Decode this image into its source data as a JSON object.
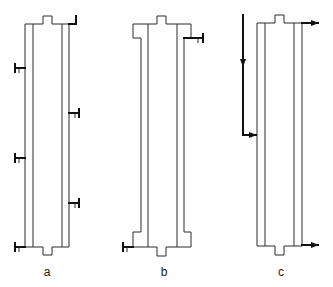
{
  "figure": {
    "panels": [
      {
        "id": "a",
        "label": "a",
        "description": "Jacketed column with multiple side valves on outer jacket",
        "valves": [
          "left-68",
          "right-113",
          "left-158",
          "right-203",
          "left-247"
        ],
        "top_port": "L-bracket outlet top-right"
      },
      {
        "id": "b",
        "label": "b",
        "description": "Jacketed column with widened end sections, one valve top-right and one bottom-left",
        "valves": [
          "right-38",
          "left-241"
        ]
      },
      {
        "id": "c",
        "label": "c",
        "description": "Jacketed column with flow arrows: inlet down and into left jacket, outlets at top-right and bottom-right",
        "arrows": [
          "inlet-down-left",
          "outlet-top-right",
          "outlet-bottom-right"
        ]
      }
    ],
    "colors": {
      "line": "#2a2a2a",
      "background": "#ffffff"
    }
  }
}
